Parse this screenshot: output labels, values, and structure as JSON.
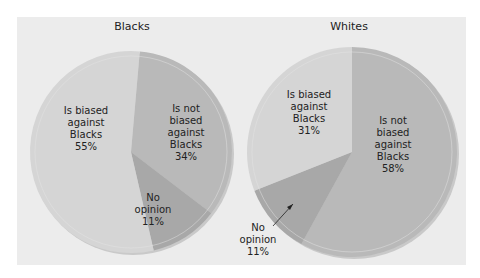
{
  "chart_data": [
    {
      "type": "pie",
      "title": "Blacks",
      "start_angle_deg": 5,
      "direction": "clockwise",
      "slices": [
        {
          "label": "Is not biased against Blacks",
          "value": 34,
          "color": "#b9b9b9"
        },
        {
          "label": "No opinion",
          "value": 11,
          "color": "#a8a8a8"
        },
        {
          "label": "Is biased against Blacks",
          "value": 55,
          "color": "#d5d5d5"
        }
      ]
    },
    {
      "type": "pie",
      "title": "Whites",
      "start_angle_deg": 0,
      "direction": "clockwise",
      "slices": [
        {
          "label": "Is not biased against Blacks",
          "value": 58,
          "color": "#b9b9b9"
        },
        {
          "label": "No opinion",
          "value": 11,
          "color": "#a8a8a8"
        },
        {
          "label": "Is biased against Blacks",
          "value": 31,
          "color": "#d5d5d5"
        }
      ]
    }
  ],
  "colors": {
    "panel_background": "#ececec",
    "light": "#d5d5d5",
    "medium": "#b9b9b9",
    "dark": "#a8a8a8"
  },
  "blacks": {
    "title": "Blacks",
    "label_biased": "Is biased\nagainst\nBlacks\n55%",
    "label_not_biased": "Is not\nbiased\nagainst\nBlacks\n34%",
    "label_no_opinion": "No\nopinion\n11%"
  },
  "whites": {
    "title": "Whites",
    "label_biased": "Is biased\nagainst\nBlacks\n31%",
    "label_not_biased": "Is not\nbiased\nagainst\nBlacks\n58%",
    "label_no_opinion": "No\nopinion\n11%"
  }
}
